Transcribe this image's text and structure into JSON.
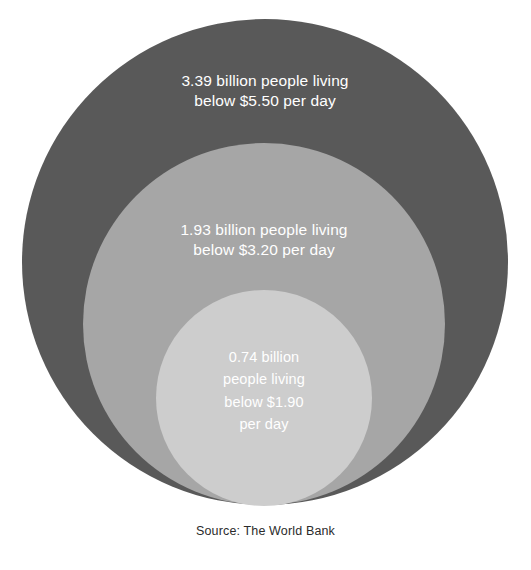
{
  "chart_data": {
    "type": "pie",
    "subtype": "nested-proportional-circles",
    "title": "",
    "subtitle": "",
    "xlabel": "",
    "ylabel": "",
    "grid": false,
    "legend_position": "none",
    "units": "billion people",
    "source": "Source: The World Bank",
    "categories": [
      "below $5.50 per day",
      "below $3.20 per day",
      "below $1.90 per day"
    ],
    "values": [
      3.39,
      1.93,
      0.74
    ],
    "series": [
      {
        "name": "People living below poverty line",
        "values": [
          3.39,
          1.93,
          0.74
        ]
      }
    ],
    "annotations": [
      "3.39 billion people living\nbelow $5.50 per day",
      "1.93 billion people living\nbelow $3.20 per day",
      "0.74 billion\npeople living\nbelow $1.90\nper day"
    ],
    "circles": [
      {
        "id": "outer",
        "value": 3.39,
        "threshold": "$5.50",
        "label": "3.39 billion people living\nbelow $5.50 per day",
        "color": "#595959",
        "radius_px": 243
      },
      {
        "id": "middle",
        "value": 1.93,
        "threshold": "$3.20",
        "label": "1.93 billion people living\nbelow $3.20 per day",
        "color": "#a6a6a6",
        "radius_px": 181
      },
      {
        "id": "inner",
        "value": 0.74,
        "threshold": "$1.90",
        "label": "0.74 billion\npeople living\nbelow $1.90\nper day",
        "color": "#cdcdcd",
        "radius_px": 108
      }
    ]
  },
  "figure": {
    "background_color": "#ffffff",
    "label_text_color": "#ffffff",
    "caption_text_color": "#2b2b2b"
  },
  "caption": {
    "text": "Source: The World Bank"
  }
}
